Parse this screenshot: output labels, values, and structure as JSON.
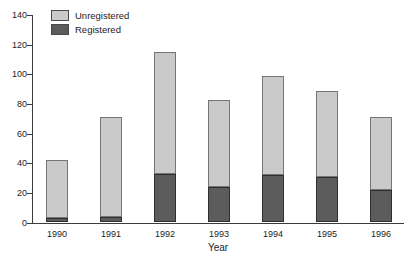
{
  "chart_data": {
    "type": "bar",
    "stacked": true,
    "title": "",
    "xlabel": "Year",
    "ylabel": "",
    "ylim": [
      0,
      140
    ],
    "yticks": [
      0,
      20,
      40,
      60,
      80,
      100,
      120,
      140
    ],
    "grid": false,
    "categories": [
      "1990",
      "1991",
      "1992",
      "1993",
      "1994",
      "1995",
      "1996"
    ],
    "series": [
      {
        "name": "Registered",
        "color": "#5c5c5c",
        "border": "#2f2f2f",
        "values": [
          3,
          4,
          33,
          24,
          32,
          31,
          22
        ]
      },
      {
        "name": "Unregistered",
        "color": "#cacaca",
        "border": "#757575",
        "values": [
          39,
          67,
          82,
          59,
          67,
          58,
          49
        ]
      }
    ],
    "totals": [
      42,
      71,
      115,
      83,
      99,
      89,
      71
    ],
    "legend": {
      "position": "top-left",
      "entries": [
        {
          "label": "Unregistered",
          "color": "#cacaca"
        },
        {
          "label": "Registered",
          "color": "#5c5c5c"
        }
      ]
    },
    "colors": {
      "axis": "#3c3c3c",
      "text": "#1c1c1c",
      "background": "#ffffff"
    }
  }
}
